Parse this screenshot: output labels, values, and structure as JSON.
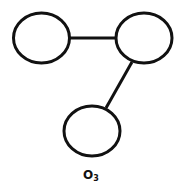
{
  "diagram": {
    "type": "molecule-structure",
    "stroke_color": "#111111",
    "fill_color": "#ffffff",
    "atoms": [
      {
        "id": "atom-left",
        "cx": 41.5,
        "cy": 38,
        "rx": 28,
        "ry": 25
      },
      {
        "id": "atom-right",
        "cx": 144,
        "cy": 38,
        "rx": 28,
        "ry": 25
      },
      {
        "id": "atom-bottom",
        "cx": 92,
        "cy": 131,
        "rx": 28,
        "ry": 25
      }
    ],
    "bonds": [
      {
        "from": "atom-left",
        "to": "atom-right",
        "x1": 69.5,
        "y1": 38,
        "x2": 116,
        "y2": 38
      },
      {
        "from": "atom-right",
        "to": "atom-bottom",
        "x1": 132,
        "y1": 62,
        "x2": 106,
        "y2": 108
      }
    ],
    "label": {
      "base": "O",
      "subscript": "3"
    }
  }
}
